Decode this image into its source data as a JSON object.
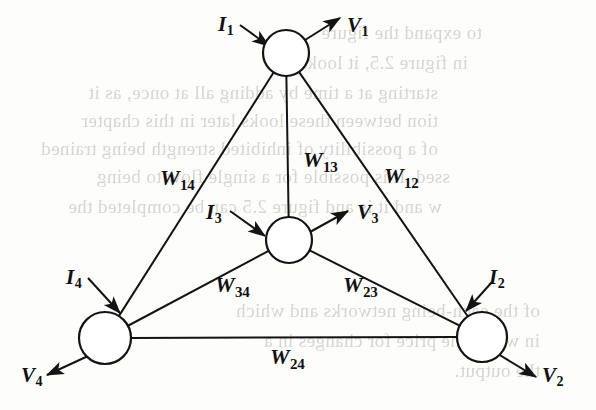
{
  "figure": {
    "type": "graph-diagram"
  },
  "nodes": [
    {
      "id": "n1",
      "name": "node-1",
      "cx": 286,
      "cy": 53,
      "r": 23
    },
    {
      "id": "n3",
      "name": "node-3",
      "cx": 289,
      "cy": 240,
      "r": 23
    },
    {
      "id": "n4",
      "name": "node-4",
      "cx": 105,
      "cy": 338,
      "r": 26
    },
    {
      "id": "n2",
      "name": "node-2",
      "cx": 482,
      "cy": 337,
      "r": 25
    }
  ],
  "edges": [
    {
      "id": "e14",
      "name": "edge-w14",
      "from": "n1",
      "to": "n4",
      "label_base": "W",
      "label_sub": "14",
      "label_x": 160,
      "label_y": 165
    },
    {
      "id": "e13",
      "name": "edge-w13",
      "from": "n1",
      "to": "n3",
      "label_base": "W",
      "label_sub": "13",
      "label_x": 303,
      "label_y": 147
    },
    {
      "id": "e12",
      "name": "edge-w12",
      "from": "n1",
      "to": "n2",
      "label_base": "W",
      "label_sub": "12",
      "label_x": 384,
      "label_y": 163
    },
    {
      "id": "e34",
      "name": "edge-w34",
      "from": "n3",
      "to": "n4",
      "label_base": "W",
      "label_sub": "34",
      "label_x": 215,
      "label_y": 272
    },
    {
      "id": "e23",
      "name": "edge-w23",
      "from": "n3",
      "to": "n2",
      "label_base": "W",
      "label_sub": "23",
      "label_x": 343,
      "label_y": 272
    },
    {
      "id": "e24",
      "name": "edge-w24",
      "from": "n2",
      "to": "n4",
      "label_base": "W",
      "label_sub": "24",
      "label_x": 270,
      "label_y": 344
    }
  ],
  "inputs": [
    {
      "id": "i1",
      "name": "input-current-1",
      "base": "I",
      "sub": "1",
      "label_x": 218,
      "label_y": 12,
      "arrow": {
        "x1": 240,
        "y1": 25,
        "x2": 269,
        "y2": 46
      }
    },
    {
      "id": "i3",
      "name": "input-current-3",
      "base": "I",
      "sub": "3",
      "label_x": 206,
      "label_y": 200,
      "arrow": {
        "x1": 230,
        "y1": 211,
        "x2": 265,
        "y2": 236
      }
    },
    {
      "id": "i4",
      "name": "input-current-4",
      "base": "I",
      "sub": "4",
      "label_x": 66,
      "label_y": 265,
      "arrow": {
        "x1": 88,
        "y1": 278,
        "x2": 120,
        "y2": 313
      }
    },
    {
      "id": "i2",
      "name": "input-current-2",
      "base": "I",
      "sub": "2",
      "label_x": 489,
      "label_y": 265,
      "arrow": {
        "x1": 492,
        "y1": 282,
        "x2": 466,
        "y2": 311
      }
    }
  ],
  "outputs": [
    {
      "id": "v1",
      "name": "output-voltage-1",
      "base": "V",
      "sub": "1",
      "label_x": 347,
      "label_y": 13,
      "arrow": {
        "x1": 305,
        "y1": 40,
        "x2": 340,
        "y2": 18
      }
    },
    {
      "id": "v3",
      "name": "output-voltage-3",
      "base": "V",
      "sub": "3",
      "label_x": 357,
      "label_y": 200,
      "arrow": {
        "x1": 310,
        "y1": 232,
        "x2": 348,
        "y2": 211
      }
    },
    {
      "id": "v4",
      "name": "output-voltage-4",
      "base": "V",
      "sub": "4",
      "label_x": 21,
      "label_y": 363,
      "arrow": {
        "x1": 88,
        "y1": 356,
        "x2": 47,
        "y2": 375
      }
    },
    {
      "id": "v2",
      "name": "output-voltage-2",
      "base": "V",
      "sub": "2",
      "label_x": 542,
      "label_y": 363,
      "arrow": {
        "x1": 498,
        "y1": 354,
        "x2": 536,
        "y2": 377
      }
    }
  ],
  "background_text": [
    {
      "text": "to expand the figure",
      "x": 62,
      "y": 22
    },
    {
      "text": "in figure 2.5, it looks like",
      "x": 48,
      "y": 52
    },
    {
      "text": "starting at a time by adding all at once, as it",
      "x": 18,
      "y": 82
    },
    {
      "text": "tion between these looks later in this chapter",
      "x": 18,
      "y": 110
    },
    {
      "text": "of a possibility of inhibited strength being trained",
      "x": 18,
      "y": 138
    },
    {
      "text": "ssed. It is possible for a single flow to being",
      "x": 30,
      "y": 166
    },
    {
      "text": "w and it is and figure 2.5 can be completed the",
      "x": 22,
      "y": 196
    },
    {
      "text": "of the each-being networks and which",
      "x": 120,
      "y": 300
    },
    {
      "text": "in which the price for changes in a",
      "x": 120,
      "y": 330
    },
    {
      "text": "the output.",
      "x": 120,
      "y": 360
    }
  ],
  "style": {
    "stroke_color": "#131313",
    "node_fill": "#ffffff",
    "background": "#fdfdfb"
  }
}
